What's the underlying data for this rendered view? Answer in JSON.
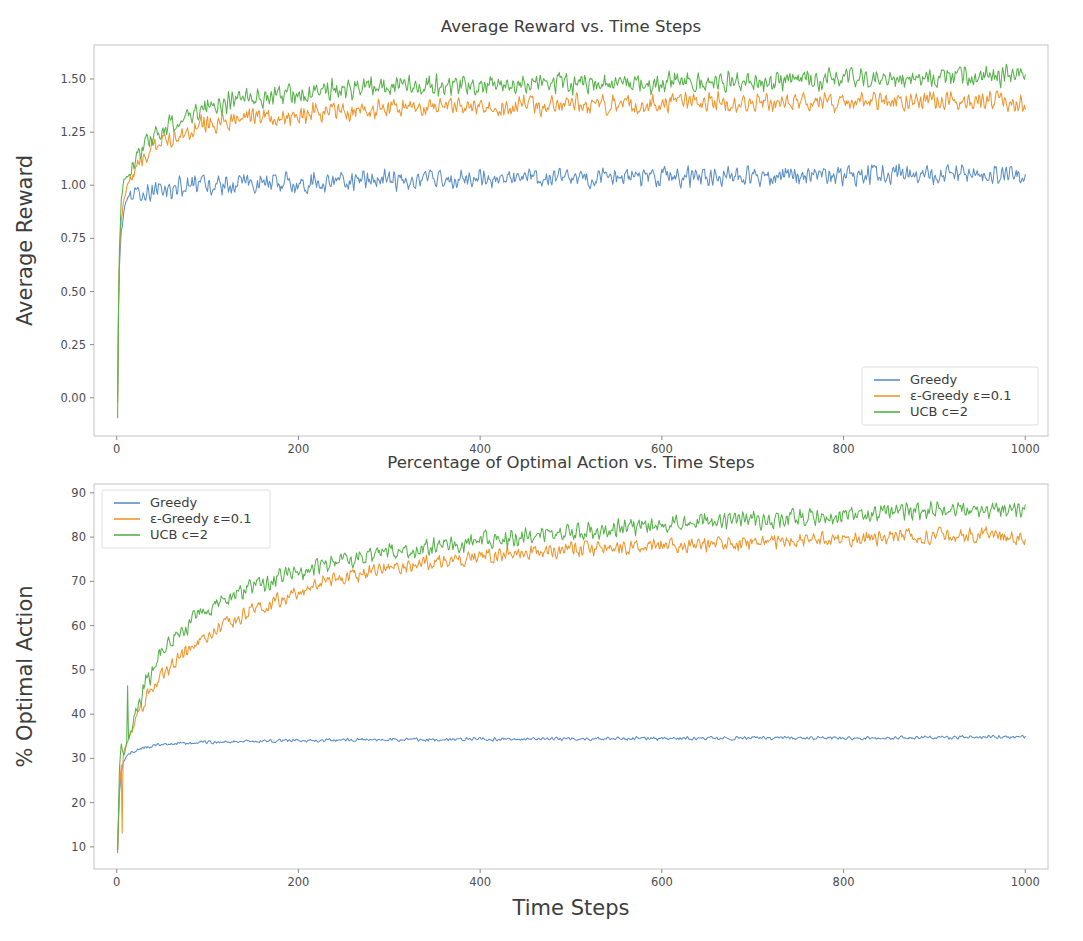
{
  "figure": {
    "width": 1083,
    "height": 941,
    "background": "#ffffff"
  },
  "colors": {
    "greedy": "#5a8fc8",
    "epsilon_greedy": "#f0952c",
    "ucb": "#56b349",
    "axis": "#c9c9c9",
    "text": "#3d3d3d"
  },
  "chart_data": [
    {
      "id": "average-reward",
      "type": "line",
      "title": "Average Reward vs. Time Steps",
      "xlabel": "",
      "ylabel": "Average Reward",
      "xlim": [
        -25,
        1025
      ],
      "ylim": [
        -0.18,
        1.66
      ],
      "xticks": [
        0,
        200,
        400,
        600,
        800,
        1000
      ],
      "yticks": [
        0.0,
        0.25,
        0.5,
        0.75,
        1.0,
        1.25,
        1.5
      ],
      "ytick_labels": [
        "0.00",
        "0.25",
        "0.50",
        "0.75",
        "1.00",
        "1.25",
        "1.50"
      ],
      "xtick_labels": [
        "0",
        "200",
        "400",
        "600",
        "800",
        "1000"
      ],
      "grid": false,
      "legend_position": "lower right",
      "series": [
        {
          "name": "Greedy",
          "color": "#5a8fc8",
          "x": [
            1,
            2,
            3,
            5,
            8,
            12,
            18,
            25,
            35,
            50,
            70,
            95,
            125,
            160,
            200,
            250,
            300,
            360,
            420,
            490,
            560,
            640,
            720,
            800,
            880,
            950,
            1000
          ],
          "values": [
            0.0,
            0.42,
            0.62,
            0.78,
            0.88,
            0.93,
            0.95,
            0.96,
            0.97,
            0.98,
            0.99,
            1.0,
            1.0,
            1.01,
            1.01,
            1.02,
            1.02,
            1.03,
            1.03,
            1.03,
            1.04,
            1.04,
            1.04,
            1.05,
            1.05,
            1.05,
            1.06
          ],
          "noise": 0.03
        },
        {
          "name": "ε-Greedy ε=0.1",
          "color": "#f0952c",
          "x": [
            1,
            2,
            3,
            5,
            8,
            12,
            18,
            25,
            35,
            50,
            70,
            95,
            125,
            160,
            200,
            250,
            300,
            360,
            420,
            490,
            560,
            640,
            720,
            800,
            880,
            950,
            1000
          ],
          "values": [
            -0.02,
            0.45,
            0.66,
            0.84,
            0.94,
            1.0,
            1.05,
            1.1,
            1.16,
            1.21,
            1.25,
            1.28,
            1.3,
            1.32,
            1.33,
            1.35,
            1.36,
            1.37,
            1.37,
            1.38,
            1.38,
            1.39,
            1.39,
            1.39,
            1.4,
            1.4,
            1.39
          ],
          "noise": 0.03
        },
        {
          "name": "UCB c=2",
          "color": "#56b349",
          "x": [
            1,
            2,
            3,
            5,
            8,
            12,
            18,
            25,
            35,
            50,
            70,
            95,
            125,
            160,
            200,
            250,
            300,
            360,
            420,
            490,
            560,
            640,
            720,
            800,
            880,
            950,
            1000
          ],
          "values": [
            -0.1,
            0.4,
            0.7,
            0.92,
            1.02,
            1.04,
            1.1,
            1.16,
            1.22,
            1.27,
            1.32,
            1.36,
            1.39,
            1.41,
            1.43,
            1.45,
            1.46,
            1.47,
            1.47,
            1.48,
            1.48,
            1.49,
            1.49,
            1.5,
            1.5,
            1.51,
            1.52
          ],
          "noise": 0.032
        }
      ]
    },
    {
      "id": "percent-optimal-action",
      "type": "line",
      "title": "Percentage of Optimal Action vs. Time Steps",
      "xlabel": "Time Steps",
      "ylabel": "% Optimal Action",
      "xlim": [
        -25,
        1025
      ],
      "ylim": [
        5,
        92
      ],
      "xticks": [
        0,
        200,
        400,
        600,
        800,
        1000
      ],
      "yticks": [
        10,
        20,
        30,
        40,
        50,
        60,
        70,
        80,
        90
      ],
      "ytick_labels": [
        "10",
        "20",
        "30",
        "40",
        "50",
        "60",
        "70",
        "80",
        "90"
      ],
      "xtick_labels": [
        "0",
        "200",
        "400",
        "600",
        "800",
        "1000"
      ],
      "grid": false,
      "legend_position": "upper left",
      "series": [
        {
          "name": "Greedy",
          "color": "#5a8fc8",
          "x": [
            1,
            2,
            3,
            5,
            8,
            12,
            18,
            25,
            35,
            50,
            70,
            95,
            125,
            160,
            200,
            250,
            300,
            360,
            420,
            490,
            560,
            640,
            720,
            800,
            880,
            950,
            1000
          ],
          "values": [
            9.5,
            16.0,
            22.0,
            27.0,
            29.5,
            30.8,
            31.6,
            32.2,
            32.7,
            33.1,
            33.4,
            33.6,
            33.8,
            33.9,
            34.0,
            34.1,
            34.2,
            34.3,
            34.3,
            34.4,
            34.5,
            34.5,
            34.6,
            34.6,
            34.7,
            34.8,
            34.9
          ],
          "noise": 0.25
        },
        {
          "name": "ε-Greedy ε=0.1",
          "color": "#f0952c",
          "x": [
            1,
            2,
            3,
            5,
            8,
            12,
            18,
            25,
            35,
            50,
            70,
            95,
            125,
            160,
            200,
            250,
            300,
            360,
            420,
            490,
            560,
            640,
            720,
            800,
            880,
            950,
            1000
          ],
          "values": [
            9.0,
            16.5,
            22.5,
            28.0,
            31.5,
            34.0,
            37.0,
            40.0,
            44.0,
            48.5,
            53.0,
            57.0,
            61.0,
            64.5,
            67.5,
            71.0,
            73.0,
            74.8,
            76.0,
            77.0,
            77.8,
            78.4,
            79.0,
            79.5,
            80.2,
            80.5,
            80.0
          ],
          "noise": 1.1
        },
        {
          "name": "UCB c=2",
          "color": "#56b349",
          "x": [
            1,
            2,
            3,
            5,
            8,
            12,
            18,
            25,
            35,
            50,
            70,
            95,
            125,
            160,
            200,
            250,
            300,
            360,
            420,
            490,
            560,
            640,
            720,
            800,
            880,
            950,
            1000
          ],
          "values": [
            8.5,
            18.0,
            28.0,
            33.0,
            31.0,
            33.5,
            38.0,
            43.0,
            48.5,
            54.0,
            59.0,
            63.0,
            66.5,
            69.5,
            72.0,
            75.0,
            76.8,
            78.3,
            79.5,
            81.0,
            82.0,
            83.2,
            84.0,
            85.0,
            85.8,
            86.3,
            86.5
          ],
          "noise": 1.3
        }
      ],
      "initial_spikes": [
        {
          "series": "UCB c=2",
          "x": 12,
          "value": 46.0
        },
        {
          "series": "ε-Greedy ε=0.1",
          "x": 6,
          "value": 13.0
        }
      ]
    }
  ]
}
